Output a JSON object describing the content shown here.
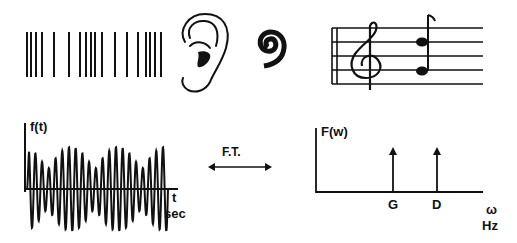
{
  "top_row": {
    "sound_wave_bars_x": [
      27,
      31,
      36,
      42,
      54,
      69,
      80,
      86,
      91,
      95,
      102,
      115,
      127,
      138,
      146,
      150,
      155,
      161
    ],
    "icons": [
      "sound-wave-bars-icon",
      "ear-icon",
      "cochlea-spiral-icon",
      "music-staff-icon"
    ],
    "staff": {
      "clef": "treble",
      "notes": [
        "D",
        "G"
      ]
    }
  },
  "time_plot": {
    "ylabel": "f(t)",
    "xlabel_top": "t",
    "xlabel_bottom": "sec"
  },
  "transform": {
    "label": "F.T."
  },
  "freq_plot": {
    "ylabel": "F(w)",
    "xlabel_top": "ω",
    "xlabel_bottom": "Hz",
    "peaks": [
      "G",
      "D"
    ]
  },
  "chart_data": [
    {
      "type": "line",
      "title": "f(t)",
      "xlabel": "t sec",
      "ylabel": "f(t)",
      "description": "Time-domain signal: sum of two sinusoids showing beats"
    },
    {
      "type": "bar",
      "title": "F(w)",
      "xlabel": "ω Hz",
      "ylabel": "F(w)",
      "categories": [
        "G",
        "D"
      ],
      "values": [
        1,
        1
      ]
    }
  ]
}
